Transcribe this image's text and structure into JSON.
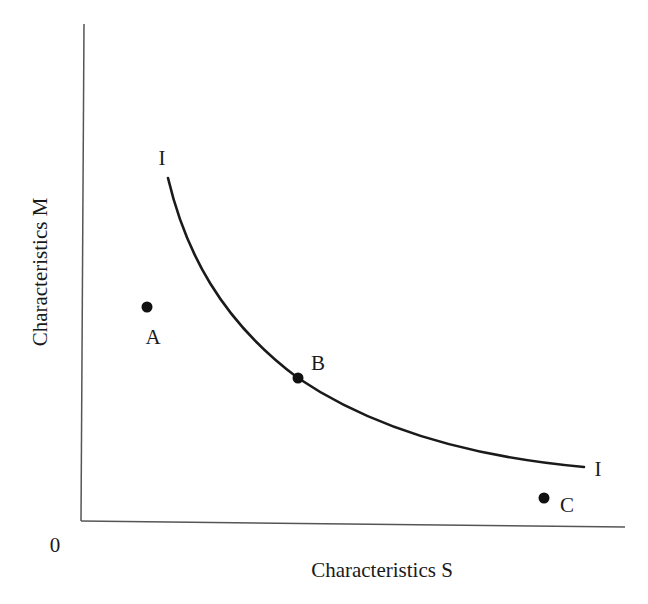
{
  "diagram": {
    "title": "",
    "axes": {
      "y_label": "Characteristics M",
      "x_label": "Characteristics S",
      "origin_label": "0"
    },
    "curve": {
      "label_top": "I",
      "label_right": "I",
      "description": "Indifference curve I, downward sloping and convex to the origin"
    },
    "points": [
      {
        "id": "A",
        "label": "A",
        "position": "below/left of curve"
      },
      {
        "id": "B",
        "label": "B",
        "position": "on curve"
      },
      {
        "id": "C",
        "label": "C",
        "position": "below/right of curve"
      }
    ],
    "colors": {
      "ink": "#1a1a1a",
      "axis": "#555555",
      "background": "#ffffff"
    }
  }
}
